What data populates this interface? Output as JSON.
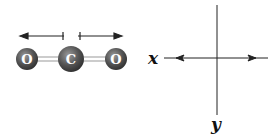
{
  "molecule": {
    "name": "CO2",
    "atoms": [
      {
        "symbol": "O"
      },
      {
        "symbol": "C"
      },
      {
        "symbol": "O"
      }
    ],
    "dipole_arrows": [
      "left",
      "right"
    ]
  },
  "axes": {
    "x_label": "x",
    "y_label": "y"
  },
  "colors": {
    "atom": "#555555",
    "line": "#222222",
    "bond": "#bbbbbb"
  }
}
